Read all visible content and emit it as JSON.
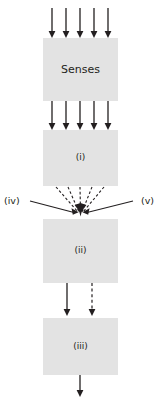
{
  "diagram": {
    "type": "flow-diagram",
    "orientation": "vertical",
    "canvas": {
      "width": 163,
      "height": 401
    },
    "background_color": "#ffffff",
    "box_fill_color": "#e3e3e3",
    "line_color": "#231f20",
    "nodes": [
      {
        "id": "senses",
        "label": "Senses",
        "shape": "rectangle",
        "x": 43,
        "y": 38,
        "width": 75,
        "height": 63,
        "label_size": "large"
      },
      {
        "id": "stage-i",
        "label": "(i)",
        "shape": "rectangle",
        "x": 43,
        "y": 130,
        "width": 75,
        "height": 56,
        "label_size": "small"
      },
      {
        "id": "stage-ii",
        "label": "(ii)",
        "shape": "rectangle",
        "x": 43,
        "y": 219,
        "width": 75,
        "height": 64,
        "label_size": "small"
      },
      {
        "id": "stage-iii",
        "label": "(iii)",
        "shape": "rectangle",
        "x": 43,
        "y": 318,
        "width": 75,
        "height": 57,
        "label_size": "small"
      }
    ],
    "side_labels": [
      {
        "id": "input-iv",
        "label": "(iv)",
        "x": 4,
        "y": 201,
        "side": "left"
      },
      {
        "id": "input-v",
        "label": "(v)",
        "x": 143,
        "y": 201,
        "side": "right"
      }
    ],
    "arrow_groups": [
      {
        "id": "sensory-input-arrows",
        "description": "five parallel downward arrows entering Senses",
        "count": 5,
        "style": "solid",
        "y_start": 8,
        "y_end": 37,
        "x_positions": [
          52,
          66,
          80,
          94,
          108
        ]
      },
      {
        "id": "senses-to-stage-i-arrows",
        "description": "five parallel downward arrows from Senses into (i)",
        "count": 5,
        "style": "solid",
        "y_start": 101,
        "y_end": 129,
        "x_positions": [
          52,
          66,
          80,
          94,
          108
        ]
      }
    ],
    "converging_fan": {
      "id": "stage-i-to-stage-ii-fan",
      "description": "five dashed lines from the bottom of (i) converging to a single arrowhead above (ii)",
      "count": 5,
      "style": "dashed",
      "source_y": 186,
      "source_x_positions": [
        56,
        68,
        80,
        92,
        104
      ],
      "converge_x": 80,
      "converge_y": 217
    },
    "external_inputs": [
      {
        "id": "input-iv-line",
        "label": "(iv)",
        "style": "solid",
        "from_x": 30,
        "from_y": 202,
        "to_x": 76,
        "to_y": 214
      },
      {
        "id": "input-v-line",
        "label": "(v)",
        "style": "solid",
        "from_x": 138,
        "from_y": 202,
        "to_x": 85,
        "to_y": 214
      }
    ],
    "stage_ii_to_iii_arrows": [
      {
        "id": "solid-arrow",
        "style": "solid",
        "x": 67,
        "y_start": 283,
        "y_end": 316
      },
      {
        "id": "dashed-arrow",
        "style": "dashed",
        "x": 92,
        "y_start": 283,
        "y_end": 316
      }
    ],
    "output_arrow": {
      "id": "stage-iii-output-arrow",
      "style": "solid",
      "x": 80,
      "y_start": 375,
      "y_end": 397
    }
  }
}
